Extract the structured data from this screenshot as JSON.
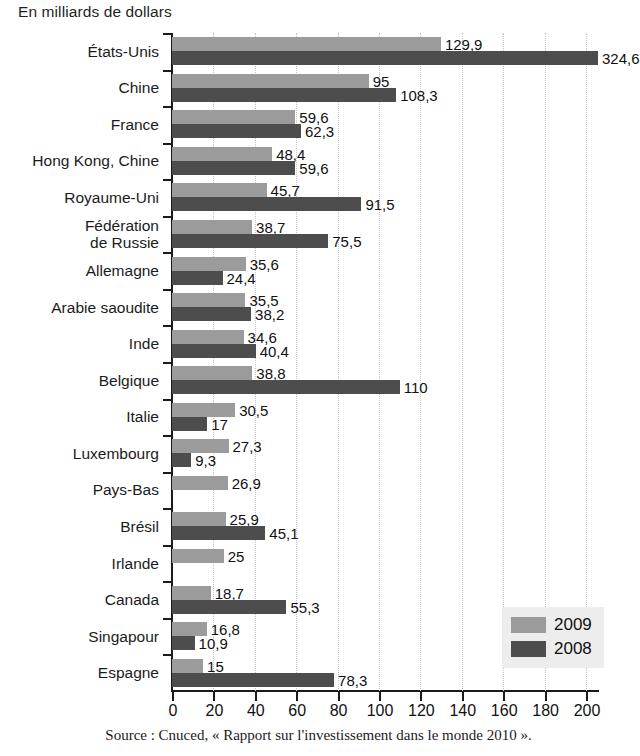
{
  "subtitle": "En milliards de dollars",
  "source": "Source : Cnuced, « Rapport sur l'investissement dans le monde 2010 ».",
  "legend": {
    "items": [
      {
        "label": "2009",
        "color": "#9b9b9b"
      },
      {
        "label": "2008",
        "color": "#4d4d4d"
      }
    ]
  },
  "chart_data": {
    "type": "bar",
    "orientation": "horizontal",
    "title": "",
    "subtitle": "En milliards de dollars",
    "xlabel": "",
    "ylabel": "",
    "xlim": [
      0,
      200
    ],
    "xticks": [
      0,
      20,
      40,
      60,
      80,
      100,
      120,
      140,
      160,
      180,
      200
    ],
    "xtick_labels": [
      "0",
      "20",
      "40",
      "60",
      "80",
      "100",
      "120",
      "140",
      "160",
      "180",
      "200"
    ],
    "grid": "vertical-dotted",
    "legend_position": "bottom-right",
    "note": "Valeur 324,6 (États-Unis 2008) dépasse l'axe et la barre est tronquée.",
    "categories": [
      "États-Unis",
      "Chine",
      "France",
      "Hong Kong, Chine",
      "Royaume-Uni",
      "Fédération\nde Russie",
      "Allemagne",
      "Arabie saoudite",
      "Inde",
      "Belgique",
      "Italie",
      "Luxembourg",
      "Pays-Bas",
      "Brésil",
      "Irlande",
      "Canada",
      "Singapour",
      "Espagne"
    ],
    "series": [
      {
        "name": "2009",
        "color": "#9b9b9b",
        "values": [
          129.9,
          95,
          59.6,
          48.4,
          45.7,
          38.7,
          35.6,
          35.5,
          34.6,
          38.8,
          30.5,
          27.3,
          26.9,
          25.9,
          25,
          18.7,
          16.8,
          15
        ],
        "labels": [
          "129,9",
          "95",
          "59,6",
          "48,4",
          "45,7",
          "38,7",
          "35,6",
          "35,5",
          "34,6",
          "38,8",
          "30,5",
          "27,3",
          "26,9",
          "25,9",
          "25",
          "18,7",
          "16,8",
          "15"
        ]
      },
      {
        "name": "2008",
        "color": "#4d4d4d",
        "values": [
          324.6,
          108.3,
          62.3,
          59.6,
          91.5,
          75.5,
          24.4,
          38.2,
          40.4,
          110,
          17,
          9.3,
          null,
          45.1,
          null,
          55.3,
          10.9,
          78.3
        ],
        "labels": [
          "324,6",
          "108,3",
          "62,3",
          "59,6",
          "91,5",
          "75,5",
          "24,4",
          "38,2",
          "40,4",
          "110",
          "17",
          "9,3",
          "",
          "45,1",
          "",
          "55,3",
          "10,9",
          "78,3"
        ]
      }
    ]
  }
}
